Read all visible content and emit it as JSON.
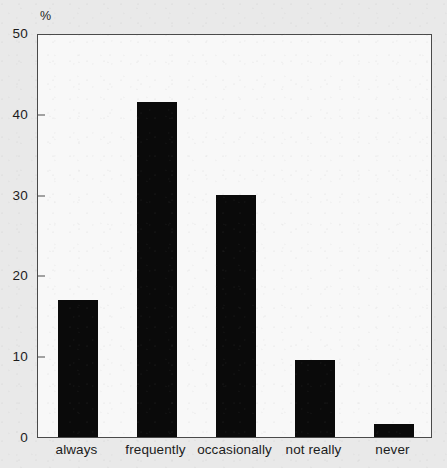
{
  "chart_data": {
    "type": "bar",
    "title": "",
    "subtitle": "",
    "xlabel": "",
    "ylabel": "%",
    "categories": [
      "always",
      "frequently",
      "occasionally",
      "not really",
      "never"
    ],
    "values": [
      17,
      41.5,
      30,
      9.5,
      1.6
    ],
    "series": [
      {
        "name": "",
        "values": [
          17,
          41.5,
          30,
          9.5,
          1.6
        ]
      }
    ],
    "ylim": [
      0,
      50
    ],
    "yticks": [
      0,
      10,
      20,
      30,
      40,
      50
    ],
    "ytick_labels": [
      "0",
      "10",
      "20",
      "30",
      "40",
      "50"
    ],
    "grid": false,
    "legend": false,
    "legend_position": "none",
    "bar_color": "#0a0a0a",
    "plot_background_color": "#f8f8f8",
    "figure_background_color": "#e9e9e9",
    "axis_color": "#4a4a4a",
    "annotations": []
  }
}
